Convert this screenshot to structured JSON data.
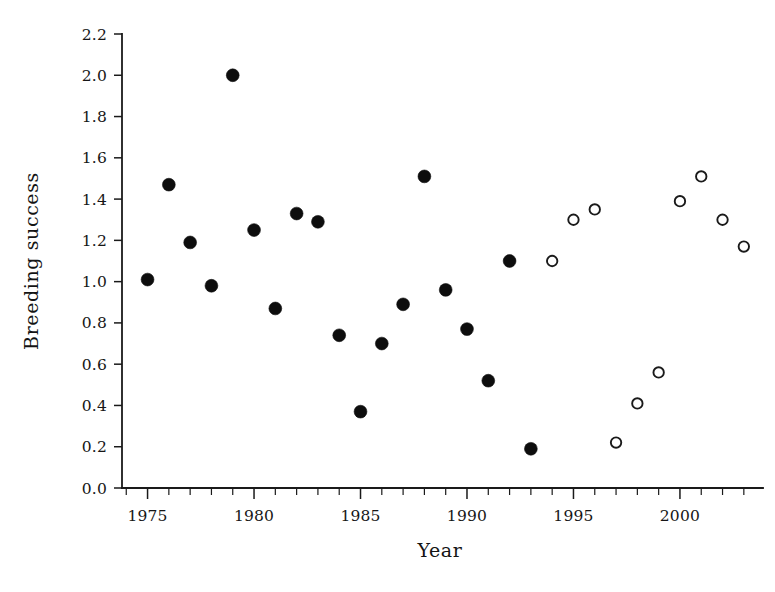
{
  "chart_data": {
    "type": "scatter",
    "title": "",
    "xlabel": "Year",
    "ylabel": "Breeding success",
    "xlim": [
      1973.8,
      2003.9
    ],
    "ylim": [
      0.0,
      2.2
    ],
    "grid": false,
    "legend": "none",
    "x_tick_labels": [
      "1975",
      "1980",
      "1985",
      "1990",
      "1995",
      "2000"
    ],
    "x_tick_values": [
      1975,
      1980,
      1985,
      1990,
      1995,
      2000
    ],
    "x_minor_tick_values": [
      1974,
      1976,
      1977,
      1978,
      1979,
      1981,
      1982,
      1983,
      1984,
      1986,
      1987,
      1988,
      1989,
      1991,
      1992,
      1993,
      1994,
      1996,
      1997,
      1998,
      1999,
      2001,
      2002,
      2003
    ],
    "y_tick_labels": [
      "0.0",
      "0.2",
      "0.4",
      "0.6",
      "0.8",
      "1.0",
      "1.2",
      "1.4",
      "1.6",
      "1.8",
      "2.0",
      "2.2"
    ],
    "y_tick_values": [
      0.0,
      0.2,
      0.4,
      0.6,
      0.8,
      1.0,
      1.2,
      1.4,
      1.6,
      1.8,
      2.0,
      2.2
    ],
    "marker_colors": {
      "filled": "#0d0d0d",
      "open_fill": "#ffffff",
      "open_stroke": "#1a1a1a"
    },
    "series": [
      {
        "name": "filled-circles",
        "marker": "filled-circle",
        "x": [
          1975,
          1976,
          1977,
          1978,
          1979,
          1980,
          1981,
          1982,
          1983,
          1984,
          1985,
          1986,
          1987,
          1988,
          1989,
          1990,
          1991,
          1992,
          1993
        ],
        "y": [
          1.01,
          1.47,
          1.19,
          0.98,
          2.0,
          1.25,
          0.87,
          1.33,
          1.29,
          0.74,
          0.37,
          0.7,
          0.89,
          1.51,
          0.96,
          0.77,
          0.52,
          1.1,
          0.19
        ],
        "points": [
          {
            "x": 1975,
            "y": 1.01
          },
          {
            "x": 1976,
            "y": 1.47
          },
          {
            "x": 1977,
            "y": 1.19
          },
          {
            "x": 1978,
            "y": 0.98
          },
          {
            "x": 1979,
            "y": 2.0
          },
          {
            "x": 1980,
            "y": 1.25
          },
          {
            "x": 1981,
            "y": 0.87
          },
          {
            "x": 1982,
            "y": 1.33
          },
          {
            "x": 1983,
            "y": 1.29
          },
          {
            "x": 1984,
            "y": 0.74
          },
          {
            "x": 1985,
            "y": 0.37
          },
          {
            "x": 1986,
            "y": 0.7
          },
          {
            "x": 1987,
            "y": 0.89
          },
          {
            "x": 1988,
            "y": 1.51
          },
          {
            "x": 1989,
            "y": 0.96
          },
          {
            "x": 1990,
            "y": 0.77
          },
          {
            "x": 1991,
            "y": 0.52
          },
          {
            "x": 1992,
            "y": 1.1
          },
          {
            "x": 1993,
            "y": 0.19
          }
        ]
      },
      {
        "name": "open-circles",
        "marker": "open-circle",
        "x": [
          1994,
          1995,
          1996,
          1997,
          1998,
          1999,
          2000,
          2001,
          2002,
          2003
        ],
        "y": [
          1.1,
          1.3,
          1.35,
          0.22,
          0.41,
          0.56,
          1.39,
          1.51,
          1.3,
          1.17
        ],
        "points": [
          {
            "x": 1994,
            "y": 1.1
          },
          {
            "x": 1995,
            "y": 1.3
          },
          {
            "x": 1996,
            "y": 1.35
          },
          {
            "x": 1997,
            "y": 0.22
          },
          {
            "x": 1998,
            "y": 0.41
          },
          {
            "x": 1999,
            "y": 0.56
          },
          {
            "x": 2000,
            "y": 1.39
          },
          {
            "x": 2001,
            "y": 1.51
          },
          {
            "x": 2002,
            "y": 1.3
          },
          {
            "x": 2003,
            "y": 1.17
          }
        ]
      }
    ]
  }
}
